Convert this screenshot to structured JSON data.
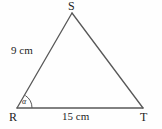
{
  "figure": {
    "kind": "geometry-diagram",
    "shape": "triangle",
    "background_color": "#fefefe",
    "stroke_color": "#585858",
    "text_color": "#1d1d1d",
    "vertices": [
      {
        "name": "S",
        "label": "S",
        "x": 72,
        "y": 13
      },
      {
        "name": "R",
        "label": "R",
        "x": 17,
        "y": 108
      },
      {
        "name": "T",
        "label": "T",
        "x": 143,
        "y": 108
      }
    ],
    "sides": [
      {
        "name": "RS",
        "label": "9 cm",
        "length": 9,
        "unit": "cm"
      },
      {
        "name": "RT",
        "label": "15 cm",
        "length": 15,
        "unit": "cm"
      },
      {
        "name": "ST",
        "label": "",
        "length": null,
        "unit": ""
      }
    ],
    "angles": [
      {
        "at_vertex": "R",
        "label": "α",
        "marker": "arc"
      }
    ]
  }
}
